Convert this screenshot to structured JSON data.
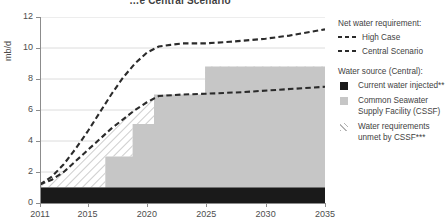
{
  "chart_title": "…e Central Scenario",
  "axes": {
    "ylabel": "mb/d",
    "yticks": [
      "0",
      "2",
      "4",
      "6",
      "8",
      "10",
      "12"
    ],
    "xticks": [
      "2011",
      "2015",
      "2020",
      "2025",
      "2030",
      "2035"
    ]
  },
  "legend": {
    "heading_requirement": "Net water requirement:",
    "items_requirement": [
      {
        "label": "High Case",
        "swatch": "dashed-line-icon"
      },
      {
        "label": "Central Scenario",
        "swatch": "dashed-line-icon"
      }
    ],
    "heading_source": "Water source (Central):",
    "items_source": [
      {
        "label": "Current water injected**",
        "swatch": "black-square-icon"
      },
      {
        "label": "Common Seawater Supply Facility (CSSF)",
        "swatch": "gray-square-icon"
      },
      {
        "label": "Water requirements unmet by CSSF***",
        "swatch": "hatched-square-icon"
      }
    ]
  },
  "colors": {
    "axis": "#8c8c8c",
    "grid": "#dcdcdc",
    "current_water": "#1a1a1a",
    "cssf": "#c6c6c6",
    "unmet_hatch": "#b4b4b4",
    "dash_line": "#2b2b2b",
    "text": "#3f3f3f"
  },
  "chart_data": {
    "type": "area",
    "title": "…e Central Scenario",
    "xlabel": "",
    "ylabel": "mb/d",
    "xlim": [
      2011,
      2035
    ],
    "ylim": [
      0,
      12
    ],
    "grid": true,
    "legend_position": "right",
    "xticks": [
      2011,
      2015,
      2020,
      2025,
      2030,
      2035
    ],
    "yticks": [
      0,
      2,
      4,
      6,
      8,
      10,
      12
    ],
    "series": [
      {
        "name": "High Case",
        "type": "line",
        "style": "dashed",
        "x": [
          2011,
          2012,
          2013,
          2014,
          2015,
          2016,
          2017,
          2018,
          2019,
          2020,
          2021,
          2022,
          2023,
          2025,
          2027,
          2030,
          2032,
          2035
        ],
        "values": [
          1.2,
          1.7,
          2.5,
          3.5,
          4.6,
          5.8,
          7.0,
          8.1,
          9.0,
          9.7,
          10.1,
          10.2,
          10.3,
          10.3,
          10.4,
          10.6,
          10.8,
          11.2
        ]
      },
      {
        "name": "Central Scenario",
        "type": "line",
        "style": "dashed",
        "x": [
          2011,
          2012,
          2013,
          2014,
          2015,
          2016,
          2017,
          2018,
          2019,
          2020,
          2021,
          2023,
          2025,
          2028,
          2031,
          2035
        ],
        "values": [
          1.2,
          1.5,
          2.0,
          2.7,
          3.4,
          4.1,
          4.8,
          5.4,
          6.0,
          6.5,
          6.9,
          7.0,
          7.05,
          7.15,
          7.3,
          7.5
        ]
      },
      {
        "name": "Current water injected**",
        "type": "area",
        "color": "#1a1a1a",
        "x": [
          2011,
          2035
        ],
        "values": [
          1.0,
          1.0
        ]
      },
      {
        "name": "Common Seawater Supply Facility (CSSF)",
        "type": "step-area",
        "color": "#c6c6c6",
        "steps": [
          {
            "from": 2011,
            "to": 2016.5,
            "value": 1.0
          },
          {
            "from": 2016.5,
            "to": 2018.8,
            "value": 3.0
          },
          {
            "from": 2018.8,
            "to": 2020.6,
            "value": 5.1
          },
          {
            "from": 2020.6,
            "to": 2024.9,
            "value": 7.0
          },
          {
            "from": 2024.9,
            "to": 2035,
            "value": 8.8
          }
        ]
      },
      {
        "name": "Water requirements unmet by CSSF***",
        "type": "hatched-area",
        "color": "#b4b4b4",
        "description": "Region between the CSSF step area and the Central Scenario requirement curve"
      }
    ]
  }
}
